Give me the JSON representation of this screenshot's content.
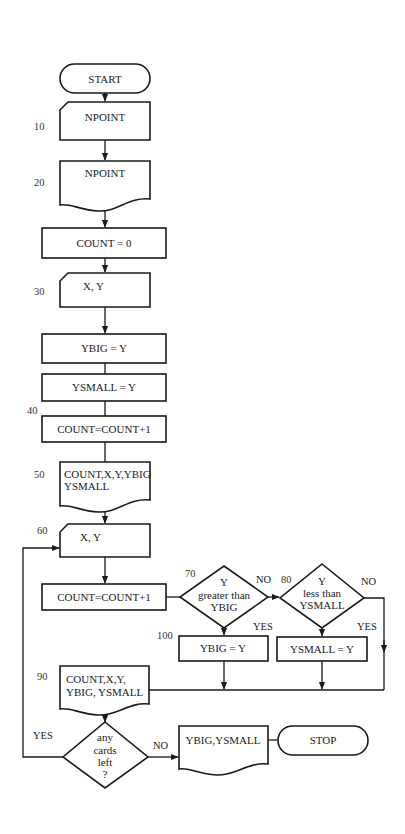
{
  "flowchart": {
    "nodes": {
      "start": {
        "label": "START"
      },
      "read_npoint": {
        "label": "NPOINT",
        "step": "10"
      },
      "print_npoint": {
        "label": "NPOINT",
        "step": "20"
      },
      "init_count": {
        "label": "COUNT = 0"
      },
      "read_xy_first": {
        "label": "X, Y",
        "step": "30"
      },
      "set_ybig": {
        "label": "YBIG = Y"
      },
      "set_ysmall": {
        "label": "YSMALL = Y"
      },
      "inc_count_first": {
        "label": "COUNT=COUNT+1",
        "step": "40"
      },
      "print_first": {
        "line1": "COUNT,X,Y,YBIG",
        "line2": "YSMALL",
        "step": "50"
      },
      "read_xy_loop": {
        "label": "X, Y",
        "step": "60"
      },
      "inc_count_loop": {
        "label": "COUNT=COUNT+1"
      },
      "decision_greater": {
        "line1": "Y",
        "line2": "greater than",
        "line3": "YBIG",
        "step": "70"
      },
      "decision_less": {
        "line1": "Y",
        "line2": "less than",
        "line3": "YSMALL",
        "step": "80"
      },
      "update_ybig": {
        "label": "YBIG = Y",
        "step": "100"
      },
      "update_ysmall": {
        "label": "YSMALL = Y"
      },
      "print_loop": {
        "line1": "COUNT,X,Y,",
        "line2": "YBIG, YSMALL",
        "step": "90"
      },
      "decision_cards": {
        "line1": "any",
        "line2": "cards",
        "line3": "left",
        "line4": "?"
      },
      "print_result": {
        "label": "YBIG,YSMALL"
      },
      "stop": {
        "label": "STOP"
      }
    },
    "edge_labels": {
      "greater_no": "NO",
      "greater_yes": "YES",
      "less_no": "NO",
      "less_yes": "YES",
      "cards_yes": "YES",
      "cards_no": "NO"
    }
  }
}
